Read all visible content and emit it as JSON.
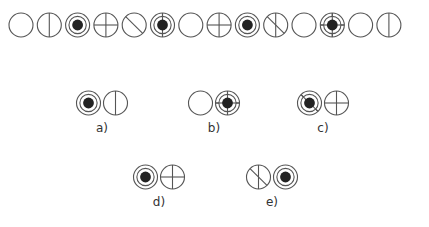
{
  "figure": {
    "type": "sequence-puzzle",
    "stroke_color": "#555555",
    "fill_color": "#222222",
    "circle_radius": 12,
    "sequence": [
      {
        "index": 1,
        "symbol": "empty"
      },
      {
        "index": 2,
        "symbol": "vertical"
      },
      {
        "index": 3,
        "symbol": "ring-dot"
      },
      {
        "index": 4,
        "symbol": "cross"
      },
      {
        "index": 5,
        "symbol": "diagonal"
      },
      {
        "index": 6,
        "symbol": "ring-dot-vertical"
      },
      {
        "index": 7,
        "symbol": "empty"
      },
      {
        "index": 8,
        "symbol": "cross"
      },
      {
        "index": 9,
        "symbol": "ring-dot"
      },
      {
        "index": 10,
        "symbol": "diagonal-vertical"
      },
      {
        "index": 11,
        "symbol": "empty"
      },
      {
        "index": 12,
        "symbol": "ring-dot-cross"
      },
      {
        "index": 13,
        "symbol": "empty"
      },
      {
        "index": 14,
        "symbol": "vertical"
      }
    ],
    "options": [
      {
        "label": "a)",
        "symbols": [
          "ring-dot",
          "vertical"
        ]
      },
      {
        "label": "b)",
        "symbols": [
          "empty",
          "ring-dot-cross"
        ]
      },
      {
        "label": "c)",
        "symbols": [
          "ring-dot-diagonal",
          "cross"
        ]
      },
      {
        "label": "d)",
        "symbols": [
          "ring-dot",
          "cross"
        ]
      },
      {
        "label": "e)",
        "symbols": [
          "diagonal-vertical",
          "ring-dot"
        ]
      }
    ]
  }
}
